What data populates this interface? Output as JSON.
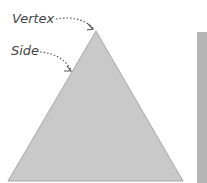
{
  "diagram": {
    "labels": {
      "vertex": "Vertex",
      "side": "Side"
    },
    "colors": {
      "triangle_fill": "#c9c9c9",
      "triangle_stroke": "#a8a8a8",
      "rect_fill": "#b5b5b5",
      "label_text": "#444444",
      "arrow": "#555555"
    }
  }
}
